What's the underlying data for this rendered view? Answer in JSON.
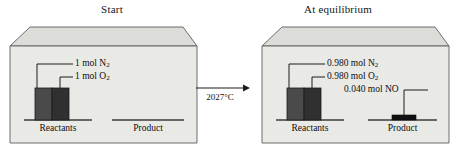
{
  "figure": {
    "type": "diagram",
    "reaction_condition": "2027°C"
  },
  "panels": [
    {
      "id": "start",
      "title": "Start",
      "axis_labels": {
        "reactants": "Reactants",
        "product": "Product"
      },
      "bars": [
        {
          "name": "N2",
          "label": "1 mol N",
          "subscript": "2",
          "amount": 1.0,
          "unit": "mol",
          "color": "#4a4a4a"
        },
        {
          "name": "O2",
          "label": "1 mol O",
          "subscript": "2",
          "amount": 1.0,
          "unit": "mol",
          "color": "#303030"
        }
      ],
      "product_bars": []
    },
    {
      "id": "equilibrium",
      "title": "At equilibrium",
      "axis_labels": {
        "reactants": "Reactants",
        "product": "Product"
      },
      "bars": [
        {
          "name": "N2",
          "label": "0.980 mol N",
          "subscript": "2",
          "amount": 0.98,
          "unit": "mol",
          "color": "#4a4a4a"
        },
        {
          "name": "O2",
          "label": "0.980 mol O",
          "subscript": "2",
          "amount": 0.98,
          "unit": "mol",
          "color": "#303030"
        }
      ],
      "product_bars": [
        {
          "name": "NO",
          "label": "0.040 mol NO",
          "subscript": "",
          "amount": 0.04,
          "unit": "mol",
          "color": "#111111"
        }
      ]
    }
  ],
  "arrow": {
    "condition_label": "2027°C",
    "direction": "right"
  },
  "colors": {
    "box_front": "#e9e9e6",
    "box_top": "#dcdcd8",
    "box_outline": "#5f5f5f",
    "bar_light": "#4a4a4a",
    "bar_dark": "#303030",
    "baseline": "#444444",
    "text": "#0f0f0f"
  }
}
